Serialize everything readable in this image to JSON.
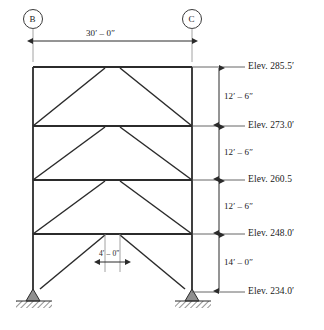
{
  "diagram": {
    "grid_bubbles": [
      {
        "label": "B",
        "name": "grid-bubble-b"
      },
      {
        "label": "C",
        "name": "grid-bubble-c"
      }
    ],
    "span_dimension": {
      "text": "30′ – 0″",
      "name": "span-dimension-label"
    },
    "bay_dimension": {
      "text": "4′ – 0″",
      "name": "brace-gap-dimension-label"
    },
    "elevations": [
      {
        "text": "Elev. 285.5′",
        "name": "elevation-label-roof"
      },
      {
        "text": "Elev. 273.0′",
        "name": "elevation-label-level4"
      },
      {
        "text": "Elev. 260.5",
        "name": "elevation-label-level3"
      },
      {
        "text": "Elev. 248.0′",
        "name": "elevation-label-level2"
      },
      {
        "text": "Elev. 234.0′",
        "name": "elevation-label-base"
      }
    ],
    "story_heights": [
      {
        "text": "12′ – 6″",
        "name": "story-height-4"
      },
      {
        "text": "12′ – 6″",
        "name": "story-height-3"
      },
      {
        "text": "12′ – 6″",
        "name": "story-height-2"
      },
      {
        "text": "14′ – 0″",
        "name": "story-height-1"
      }
    ],
    "colors": {
      "line": "#2b2b2b",
      "thin_line": "#555555",
      "background": "#ffffff",
      "support_fill": "#8f8f8f"
    }
  }
}
